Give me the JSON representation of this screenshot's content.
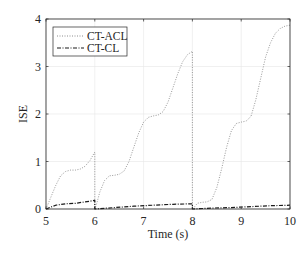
{
  "chart_data": {
    "type": "line",
    "title": "",
    "xlabel": "Time (s)",
    "ylabel": "ISE",
    "xlim": [
      5,
      10
    ],
    "ylim": [
      0,
      4
    ],
    "xticks": [
      5,
      6,
      7,
      8,
      9,
      10
    ],
    "yticks": [
      0,
      1,
      2,
      3,
      4
    ],
    "grid": true,
    "legend_position": "upper left",
    "series": [
      {
        "name": "CT-ACL",
        "style": "dotted",
        "color": "#8c8c8c",
        "x": [
          5.0,
          5.1,
          5.2,
          5.3,
          5.4,
          5.5,
          5.6,
          5.7,
          5.8,
          5.9,
          6.0,
          6.0,
          6.05,
          6.1,
          6.2,
          6.3,
          6.4,
          6.5,
          6.6,
          6.7,
          6.8,
          6.9,
          7.0,
          7.1,
          7.2,
          7.3,
          7.4,
          7.5,
          7.6,
          7.7,
          7.8,
          7.9,
          8.0,
          8.0,
          8.05,
          8.1,
          8.2,
          8.3,
          8.4,
          8.5,
          8.6,
          8.7,
          8.8,
          8.9,
          9.0,
          9.1,
          9.2,
          9.3,
          9.4,
          9.5,
          9.6,
          9.7,
          9.8,
          9.9,
          10.0
        ],
        "y": [
          0.0,
          0.25,
          0.5,
          0.7,
          0.79,
          0.82,
          0.82,
          0.84,
          0.9,
          1.02,
          1.2,
          0.0,
          0.15,
          0.35,
          0.6,
          0.7,
          0.71,
          0.73,
          0.8,
          1.0,
          1.3,
          1.6,
          1.83,
          1.93,
          1.96,
          1.98,
          2.05,
          2.25,
          2.55,
          2.85,
          3.1,
          3.25,
          3.32,
          0.0,
          0.05,
          0.12,
          0.14,
          0.15,
          0.2,
          0.45,
          0.85,
          1.3,
          1.65,
          1.8,
          1.83,
          1.85,
          1.95,
          2.3,
          2.75,
          3.2,
          3.5,
          3.7,
          3.8,
          3.85,
          3.87
        ]
      },
      {
        "name": "CT-CL",
        "style": "dash-dot",
        "color": "#1a1a1a",
        "x": [
          5.0,
          5.2,
          5.4,
          5.6,
          5.8,
          6.0,
          6.0,
          6.4,
          6.8,
          7.2,
          7.6,
          8.0,
          8.0,
          8.4,
          8.8,
          9.2,
          9.6,
          10.0
        ],
        "y": [
          0.0,
          0.08,
          0.11,
          0.12,
          0.15,
          0.18,
          0.0,
          0.03,
          0.06,
          0.08,
          0.1,
          0.11,
          0.0,
          0.02,
          0.03,
          0.05,
          0.07,
          0.08
        ]
      }
    ]
  }
}
